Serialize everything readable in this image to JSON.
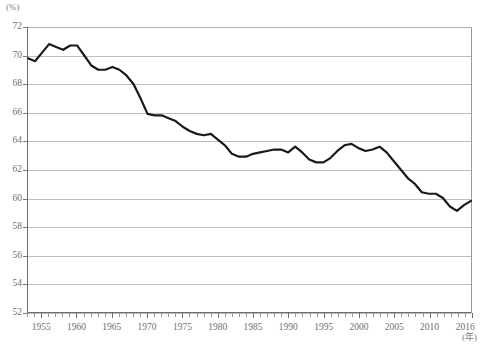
{
  "chart_data": {
    "type": "line",
    "title": "",
    "subtitle": "",
    "xlabel": "(年)",
    "ylabel": "(%)",
    "unit_y": "(%)",
    "unit_x": "(年)",
    "xlim": [
      1953,
      2016
    ],
    "ylim": [
      52,
      72
    ],
    "ytick_step": 2,
    "yticks": [
      72,
      70,
      68,
      66,
      64,
      62,
      60,
      58,
      56,
      54,
      52
    ],
    "xticks_major": [
      1955,
      1960,
      1965,
      1970,
      1975,
      1980,
      1985,
      1990,
      1995,
      2000,
      2005,
      2010,
      2016
    ],
    "xtick_minor_interval": 1,
    "grid": "horizontal",
    "legend": "none",
    "line_color": "#1a1a1a",
    "line_width": 2.2,
    "series": [
      {
        "name": "",
        "x": [
          1953,
          1954,
          1955,
          1956,
          1957,
          1958,
          1959,
          1960,
          1961,
          1962,
          1963,
          1964,
          1965,
          1966,
          1967,
          1968,
          1969,
          1970,
          1971,
          1972,
          1973,
          1974,
          1975,
          1976,
          1977,
          1978,
          1979,
          1980,
          1981,
          1982,
          1983,
          1984,
          1985,
          1986,
          1987,
          1988,
          1989,
          1990,
          1991,
          1992,
          1993,
          1994,
          1995,
          1996,
          1997,
          1998,
          1999,
          2000,
          2001,
          2002,
          2003,
          2004,
          2005,
          2006,
          2007,
          2008,
          2009,
          2010,
          2011,
          2012,
          2013,
          2014,
          2015,
          2016
        ],
        "values": [
          69.8,
          69.6,
          70.2,
          70.8,
          70.6,
          70.4,
          70.7,
          70.7,
          70.0,
          69.3,
          69.0,
          69.0,
          69.2,
          69.0,
          68.6,
          68.0,
          67.0,
          65.9,
          65.8,
          65.8,
          65.6,
          65.4,
          65.0,
          64.7,
          64.5,
          64.4,
          64.5,
          64.1,
          63.7,
          63.1,
          62.9,
          62.9,
          63.1,
          63.2,
          63.3,
          63.4,
          63.4,
          63.2,
          63.6,
          63.2,
          62.7,
          62.5,
          62.5,
          62.8,
          63.3,
          63.7,
          63.8,
          63.5,
          63.3,
          63.4,
          63.6,
          63.2,
          62.6,
          62.0,
          61.4,
          61.0,
          60.4,
          60.3,
          60.3,
          60.0,
          59.4,
          59.1,
          59.5,
          59.8
        ]
      }
    ],
    "annotations": [],
    "footnote": ""
  }
}
